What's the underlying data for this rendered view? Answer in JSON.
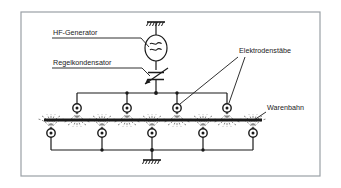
{
  "figure": {
    "background_color": "#ffffff",
    "frame_color": "#9aa0a6",
    "line_color": "#1a1a1a",
    "field_line_color": "#555555"
  },
  "labels": {
    "hf_generator": "HF-Generator",
    "regelkondensator": "Regelkondensator",
    "elektrodenstaebe": "Elektrodenstäbe",
    "warenbahn": "Warenbahn"
  },
  "components": {
    "generator": {
      "name": "HF-Generator",
      "symbol": "oscillator-circle-wave",
      "cx": 156,
      "cy": 48,
      "rx": 11,
      "ry": 13
    },
    "variable_capacitor": {
      "name": "Regelkondensator",
      "symbol": "variable-capacitor",
      "cx": 156,
      "cy": 76
    },
    "ground_top": {
      "name": "Erdung oben",
      "symbol": "ground-hatched",
      "cx": 156,
      "cy": 22
    },
    "ground_bottom": {
      "name": "Erdung unten",
      "symbol": "ground-hatched",
      "cx": 156,
      "cy": 158
    },
    "web": {
      "name": "Warenbahn",
      "y": 120,
      "x_start": 44,
      "x_end": 262,
      "thickness": 3
    },
    "top_bus": {
      "y": 93,
      "x_start": 77,
      "x_end": 227
    },
    "bottom_bus": {
      "y": 150,
      "x_start": 51,
      "x_end": 253
    },
    "top_electrodes": [
      {
        "cx": 77,
        "cy": 108,
        "r": 4.2
      },
      {
        "cx": 127,
        "cy": 108,
        "r": 4.2
      },
      {
        "cx": 177,
        "cy": 108,
        "r": 4.2
      },
      {
        "cx": 227,
        "cy": 108,
        "r": 4.2
      }
    ],
    "bottom_electrodes": [
      {
        "cx": 51,
        "cy": 133,
        "r": 4.2
      },
      {
        "cx": 102,
        "cy": 133,
        "r": 4.2
      },
      {
        "cx": 152,
        "cy": 133,
        "r": 4.2
      },
      {
        "cx": 203,
        "cy": 133,
        "r": 4.2
      },
      {
        "cx": 253,
        "cy": 133,
        "r": 4.2
      }
    ],
    "top_bus_junctions": [
      127,
      156,
      177
    ],
    "bottom_bus_junctions": [
      102,
      152,
      203
    ]
  },
  "leaders": {
    "hf_generator": {
      "x1": 52,
      "y1": 38,
      "x2": 141,
      "y2": 38,
      "x3": 148,
      "y3": 46
    },
    "regelkondensator": {
      "x1": 52,
      "y1": 68,
      "x2": 141,
      "y2": 68,
      "x3": 150,
      "y3": 75
    },
    "elektrodenstaebe_a": {
      "x1": 239,
      "y1": 56,
      "x2": 180,
      "y2": 105
    },
    "elektrodenstaebe_b": {
      "x1": 245,
      "y1": 57,
      "x2": 229,
      "y2": 104
    },
    "warenbahn": {
      "x1": 264,
      "y1": 112,
      "x2": 252,
      "y2": 120
    }
  }
}
